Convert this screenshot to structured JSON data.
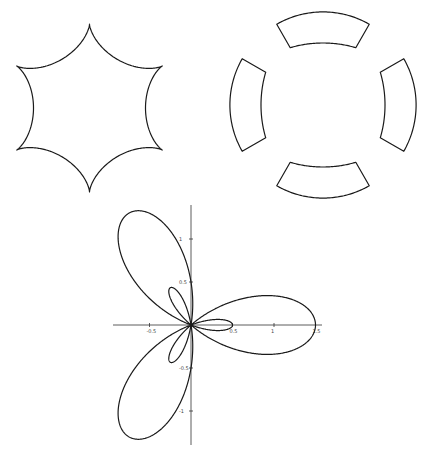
{
  "figures": [
    {
      "id": "hypocycloid",
      "description": "six-cusped star curve (hypocycloid)",
      "cusps": 6
    },
    {
      "id": "crescents",
      "description": "four crescent-shaped closed curves",
      "pieces": 4
    },
    {
      "id": "polar-rose",
      "description": "three-petal limacon rose with inner loops"
    }
  ],
  "chart_data": {
    "type": "line",
    "title": "",
    "xlabel": "",
    "ylabel": "",
    "equation": "r = 0.5 + cos(3θ)",
    "x_ticks": [
      "-0.5",
      "0.5",
      "1",
      "1.5"
    ],
    "y_ticks": [
      "1",
      "0.5",
      "-0.5",
      "-1"
    ],
    "xlim": [
      -0.9,
      1.6
    ],
    "ylim": [
      -1.4,
      1.4
    ],
    "grid": false
  },
  "axis": {
    "x_ticks": [
      {
        "label": "-0.5",
        "v": -0.5
      },
      {
        "label": "0.5",
        "v": 0.5
      },
      {
        "label": "1",
        "v": 1
      },
      {
        "label": "1.5",
        "v": 1.5
      }
    ],
    "y_ticks": [
      {
        "label": "1",
        "v": 1
      },
      {
        "label": "0.5",
        "v": 0.5
      },
      {
        "label": "-0.5",
        "v": -0.5
      },
      {
        "label": "-1",
        "v": -1
      }
    ]
  }
}
